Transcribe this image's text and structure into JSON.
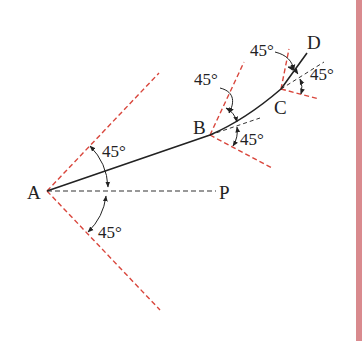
{
  "diagram": {
    "points": {
      "A": {
        "label": "A",
        "x": 47,
        "y": 191
      },
      "B": {
        "label": "B",
        "x": 210,
        "y": 135
      },
      "C": {
        "label": "C",
        "x": 281,
        "y": 89
      },
      "D": {
        "label": "D",
        "x": 307,
        "y": 53
      },
      "P": {
        "label": "P",
        "x": 215,
        "y": 191
      }
    },
    "angle_labels": {
      "A_upper": "45°",
      "A_lower": "45°",
      "B_upper": "45°",
      "B_lower": "45°",
      "C_upper": "45°",
      "C_lower": "45°"
    },
    "colors": {
      "path": "#222222",
      "reference_dashed": "#333333",
      "boundary_dashed": "#d9463c",
      "right_bar": "#d98a8e"
    }
  }
}
